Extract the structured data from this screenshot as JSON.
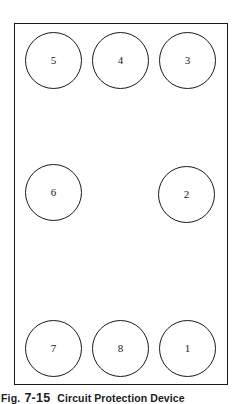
{
  "figure": {
    "panel": {
      "name": "component-layout-panel",
      "outline_color": "#18181a",
      "background_color": "#ffffff"
    },
    "caption": {
      "fig_word": "Fig.",
      "fig_number": "7-15",
      "text": "Circuit Protection Device"
    },
    "ports": [
      {
        "label": "5",
        "row": "top",
        "column": "left"
      },
      {
        "label": "4",
        "row": "top",
        "column": "center"
      },
      {
        "label": "3",
        "row": "top",
        "column": "right"
      },
      {
        "label": "6",
        "row": "middle",
        "column": "left"
      },
      {
        "label": "2",
        "row": "middle",
        "column": "right"
      },
      {
        "label": "7",
        "row": "bottom",
        "column": "left"
      },
      {
        "label": "8",
        "row": "bottom",
        "column": "center"
      },
      {
        "label": "1",
        "row": "bottom",
        "column": "right"
      }
    ]
  }
}
